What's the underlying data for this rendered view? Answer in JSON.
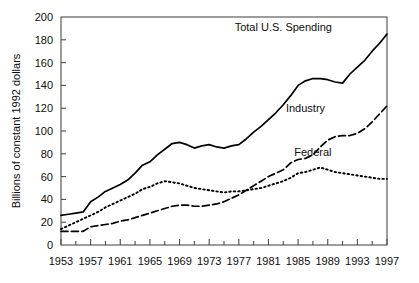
{
  "chart_data": {
    "type": "line",
    "title": "",
    "xlabel": "",
    "ylabel": "Billions of constant 1992 dollars",
    "xlim": [
      1953,
      1997
    ],
    "ylim": [
      0,
      200
    ],
    "ytick_step": 20,
    "xtick_step": 4,
    "x_minor_step": 2,
    "grid": false,
    "legend_position": "inline-annotations",
    "yticks": [
      "0",
      "20",
      "40",
      "60",
      "80",
      "100",
      "120",
      "140",
      "160",
      "180",
      "200"
    ],
    "xticks": [
      "1953",
      "1957",
      "1961",
      "1965",
      "1969",
      "1973",
      "1977",
      "1981",
      "1985",
      "1989",
      "1993",
      "1997"
    ],
    "x": [
      1953,
      1954,
      1955,
      1956,
      1957,
      1958,
      1959,
      1960,
      1961,
      1962,
      1963,
      1964,
      1965,
      1966,
      1967,
      1968,
      1969,
      1970,
      1971,
      1972,
      1973,
      1974,
      1975,
      1976,
      1977,
      1978,
      1979,
      1980,
      1981,
      1982,
      1983,
      1984,
      1985,
      1986,
      1987,
      1988,
      1989,
      1990,
      1991,
      1992,
      1993,
      1994,
      1995,
      1996,
      1997
    ],
    "series": [
      {
        "name": "Total U.S. Spending",
        "style": "solid",
        "color": "#000000",
        "label_x": 1983,
        "label_y": 188,
        "values": [
          26,
          27,
          28,
          29,
          38,
          42,
          47,
          50,
          53,
          57,
          63,
          70,
          73,
          79,
          84,
          89,
          90,
          88,
          85,
          87,
          88,
          86,
          85,
          87,
          88,
          93,
          99,
          104,
          110,
          116,
          123,
          131,
          140,
          144,
          146,
          146,
          145,
          143,
          142,
          150,
          156,
          162,
          170,
          177,
          185
        ]
      },
      {
        "name": "Industry",
        "style": "dashed",
        "color": "#000000",
        "label_x": 1986,
        "label_y": 117,
        "values": [
          12,
          12,
          12,
          12,
          16,
          17,
          18,
          19,
          21,
          22,
          24,
          26,
          28,
          30,
          32,
          34,
          35,
          35,
          34,
          34,
          35,
          36,
          38,
          41,
          44,
          48,
          52,
          56,
          60,
          63,
          66,
          72,
          75,
          76,
          79,
          86,
          92,
          95,
          96,
          96,
          98,
          102,
          108,
          115,
          122
        ]
      },
      {
        "name": "Federal",
        "style": "dotted",
        "color": "#000000",
        "label_x": 1987,
        "label_y": 78,
        "values": [
          14,
          17,
          20,
          23,
          26,
          29,
          33,
          36,
          39,
          42,
          45,
          49,
          51,
          54,
          56,
          55,
          54,
          52,
          50,
          49,
          48,
          47,
          46,
          47,
          47,
          48,
          49,
          50,
          52,
          54,
          56,
          59,
          63,
          64,
          66,
          68,
          66,
          64,
          63,
          62,
          61,
          60,
          59,
          58,
          58
        ]
      }
    ]
  }
}
